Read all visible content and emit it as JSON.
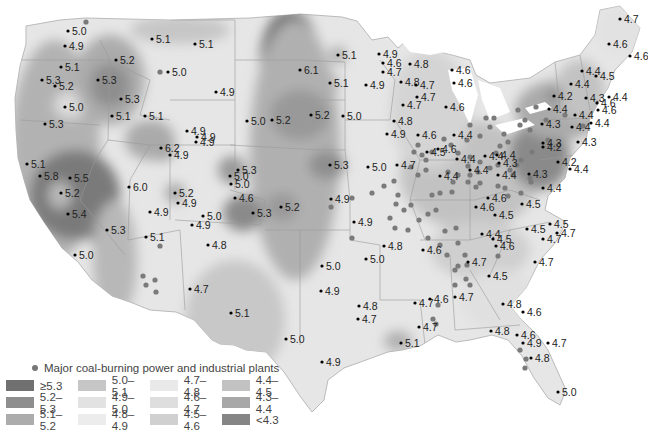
{
  "legend": {
    "plants_label": "Major coal-burning power and industrial plants",
    "items": [
      {
        "label": "≥5.3",
        "color": "#707070"
      },
      {
        "label": "5.0–5.1",
        "color": "#c6c6c6"
      },
      {
        "label": "4.7–4.8",
        "color": "#e9e9e9"
      },
      {
        "label": "4.4–4.5",
        "color": "#c2c2c2"
      },
      {
        "label": "5.2–5.3",
        "color": "#8e8e8e"
      },
      {
        "label": "4.9–5.0",
        "color": "#e2e2e2"
      },
      {
        "label": "4.6–4.7",
        "color": "#dedede"
      },
      {
        "label": "4.3–4.4",
        "color": "#a8a8a8"
      },
      {
        "label": "5.1–5.2",
        "color": "#acacac"
      },
      {
        "label": "4.8–4.9",
        "color": "#ececec"
      },
      {
        "label": "4.5–4.6",
        "color": "#d0d0d0"
      },
      {
        "label": "<4.3",
        "color": "#858585"
      }
    ]
  },
  "stations": [
    {
      "v": "5.0",
      "x": 68,
      "y": 31
    },
    {
      "v": "4.9",
      "x": 65,
      "y": 46
    },
    {
      "v": "5.1",
      "x": 61,
      "y": 67
    },
    {
      "v": "5.3",
      "x": 42,
      "y": 80
    },
    {
      "v": "5.2",
      "x": 55,
      "y": 86
    },
    {
      "v": "5.0",
      "x": 65,
      "y": 107
    },
    {
      "v": "5.3",
      "x": 45,
      "y": 124
    },
    {
      "v": "5.2",
      "x": 116,
      "y": 60
    },
    {
      "v": "5.3",
      "x": 98,
      "y": 80
    },
    {
      "v": "5.3",
      "x": 121,
      "y": 99
    },
    {
      "v": "5.1",
      "x": 112,
      "y": 116
    },
    {
      "v": "5.1",
      "x": 145,
      "y": 116
    },
    {
      "v": "5.1",
      "x": 152,
      "y": 39
    },
    {
      "v": "5.1",
      "x": 195,
      "y": 44
    },
    {
      "v": "5.0",
      "x": 168,
      "y": 72
    },
    {
      "v": "4.9",
      "x": 216,
      "y": 92
    },
    {
      "v": "4.9",
      "x": 187,
      "y": 131
    },
    {
      "v": "4.9",
      "x": 197,
      "y": 137
    },
    {
      "v": "4.9",
      "x": 196,
      "y": 142
    },
    {
      "v": "6.2",
      "x": 161,
      "y": 148
    },
    {
      "v": "4.9",
      "x": 170,
      "y": 155
    },
    {
      "v": "5.1",
      "x": 27,
      "y": 164
    },
    {
      "v": "5.8",
      "x": 40,
      "y": 176
    },
    {
      "v": "5.5",
      "x": 70,
      "y": 178
    },
    {
      "v": "5.2",
      "x": 61,
      "y": 193
    },
    {
      "v": "5.4",
      "x": 68,
      "y": 214
    },
    {
      "v": "5.0",
      "x": 75,
      "y": 255
    },
    {
      "v": "6.0",
      "x": 129,
      "y": 187
    },
    {
      "v": "5.2",
      "x": 175,
      "y": 193
    },
    {
      "v": "4.9",
      "x": 178,
      "y": 203
    },
    {
      "v": "4.9",
      "x": 150,
      "y": 212
    },
    {
      "v": "5.3",
      "x": 107,
      "y": 230
    },
    {
      "v": "5.1",
      "x": 146,
      "y": 237
    },
    {
      "v": "5.0",
      "x": 203,
      "y": 216
    },
    {
      "v": "4.9",
      "x": 192,
      "y": 225
    },
    {
      "v": "4.8",
      "x": 208,
      "y": 245
    },
    {
      "v": "4.7",
      "x": 190,
      "y": 289
    },
    {
      "v": "5.1",
      "x": 231,
      "y": 313
    },
    {
      "v": "5.0",
      "x": 286,
      "y": 339
    },
    {
      "v": "4.9",
      "x": 322,
      "y": 362
    },
    {
      "v": "6.1",
      "x": 300,
      "y": 70
    },
    {
      "v": "5.0",
      "x": 247,
      "y": 121
    },
    {
      "v": "5.2",
      "x": 272,
      "y": 120
    },
    {
      "v": "5.2",
      "x": 311,
      "y": 115
    },
    {
      "v": "5.0",
      "x": 343,
      "y": 116
    },
    {
      "v": "5.3",
      "x": 238,
      "y": 170
    },
    {
      "v": "5.0",
      "x": 230,
      "y": 176
    },
    {
      "v": "5.0",
      "x": 231,
      "y": 184
    },
    {
      "v": "4.6",
      "x": 235,
      "y": 198
    },
    {
      "v": "5.3",
      "x": 253,
      "y": 213
    },
    {
      "v": "5.2",
      "x": 281,
      "y": 207
    },
    {
      "v": "5.3",
      "x": 330,
      "y": 165
    },
    {
      "v": "5.0",
      "x": 368,
      "y": 167
    },
    {
      "v": "4.9",
      "x": 331,
      "y": 199
    },
    {
      "v": "4.9",
      "x": 354,
      "y": 222
    },
    {
      "v": "5.0",
      "x": 322,
      "y": 266
    },
    {
      "v": "4.9",
      "x": 321,
      "y": 291
    },
    {
      "v": "4.8",
      "x": 359,
      "y": 306
    },
    {
      "v": "4.7",
      "x": 358,
      "y": 319
    },
    {
      "v": "5.1",
      "x": 338,
      "y": 55
    },
    {
      "v": "5.1",
      "x": 330,
      "y": 83
    },
    {
      "v": "4.9",
      "x": 366,
      "y": 85
    },
    {
      "v": "4.9",
      "x": 379,
      "y": 54
    },
    {
      "v": "4.6",
      "x": 383,
      "y": 63
    },
    {
      "v": "4.8",
      "x": 410,
      "y": 64
    },
    {
      "v": "4.7",
      "x": 383,
      "y": 72
    },
    {
      "v": "4.8",
      "x": 401,
      "y": 82
    },
    {
      "v": "4.7",
      "x": 416,
      "y": 85
    },
    {
      "v": "4.7",
      "x": 417,
      "y": 97
    },
    {
      "v": "4.7",
      "x": 403,
      "y": 105
    },
    {
      "v": "4.8",
      "x": 394,
      "y": 121
    },
    {
      "v": "4.9",
      "x": 387,
      "y": 134
    },
    {
      "v": "4.6",
      "x": 452,
      "y": 70
    },
    {
      "v": "4.6",
      "x": 454,
      "y": 83
    },
    {
      "v": "4.6",
      "x": 446,
      "y": 107
    },
    {
      "v": "4.6",
      "x": 418,
      "y": 135
    },
    {
      "v": "4.4",
      "x": 454,
      "y": 135
    },
    {
      "v": "4.7",
      "x": 397,
      "y": 165
    },
    {
      "v": "4.5",
      "x": 427,
      "y": 152
    },
    {
      "v": "4.6",
      "x": 438,
      "y": 149
    },
    {
      "v": "4.4",
      "x": 457,
      "y": 159
    },
    {
      "v": "4.4",
      "x": 440,
      "y": 176
    },
    {
      "v": "4.4",
      "x": 485,
      "y": 156
    },
    {
      "v": "4.4",
      "x": 470,
      "y": 170
    },
    {
      "v": "4.4",
      "x": 497,
      "y": 155
    },
    {
      "v": "4.4",
      "x": 498,
      "y": 175
    },
    {
      "v": "4.3",
      "x": 499,
      "y": 163
    },
    {
      "v": "4.3",
      "x": 529,
      "y": 174
    },
    {
      "v": "4.6",
      "x": 488,
      "y": 198
    },
    {
      "v": "4.6",
      "x": 476,
      "y": 207
    },
    {
      "v": "4.5",
      "x": 495,
      "y": 215
    },
    {
      "v": "4.8",
      "x": 384,
      "y": 246
    },
    {
      "v": "4.6",
      "x": 423,
      "y": 250
    },
    {
      "v": "5.0",
      "x": 366,
      "y": 259
    },
    {
      "v": "4.4",
      "x": 482,
      "y": 234
    },
    {
      "v": "4.5",
      "x": 493,
      "y": 239
    },
    {
      "v": "4.6",
      "x": 496,
      "y": 246
    },
    {
      "v": "4.7",
      "x": 468,
      "y": 262
    },
    {
      "v": "4.5",
      "x": 489,
      "y": 276
    },
    {
      "v": "4.5",
      "x": 527,
      "y": 229
    },
    {
      "v": "4.5",
      "x": 550,
      "y": 224
    },
    {
      "v": "4.7",
      "x": 557,
      "y": 233
    },
    {
      "v": "4.7",
      "x": 543,
      "y": 239
    },
    {
      "v": "4.7",
      "x": 535,
      "y": 262
    },
    {
      "v": "4.7",
      "x": 415,
      "y": 303
    },
    {
      "v": "4.6",
      "x": 430,
      "y": 299
    },
    {
      "v": "4.7",
      "x": 455,
      "y": 297
    },
    {
      "v": "4.8",
      "x": 503,
      "y": 304
    },
    {
      "v": "4.6",
      "x": 523,
      "y": 312
    },
    {
      "v": "4.8",
      "x": 491,
      "y": 331
    },
    {
      "v": "4.6",
      "x": 517,
      "y": 335
    },
    {
      "v": "4.9",
      "x": 523,
      "y": 343
    },
    {
      "v": "4.7",
      "x": 548,
      "y": 343
    },
    {
      "v": "4.8",
      "x": 531,
      "y": 358
    },
    {
      "v": "5.0",
      "x": 558,
      "y": 392
    },
    {
      "v": "4.7",
      "x": 419,
      "y": 327
    },
    {
      "v": "5.1",
      "x": 401,
      "y": 343
    },
    {
      "v": "4.7",
      "x": 620,
      "y": 19
    },
    {
      "v": "4.6",
      "x": 609,
      "y": 44
    },
    {
      "v": "4.6",
      "x": 630,
      "y": 56
    },
    {
      "v": "4.4",
      "x": 582,
      "y": 71
    },
    {
      "v": "4.4",
      "x": 571,
      "y": 84
    },
    {
      "v": "4.5",
      "x": 596,
      "y": 76
    },
    {
      "v": "4.3",
      "x": 586,
      "y": 98
    },
    {
      "v": "4.4",
      "x": 609,
      "y": 97
    },
    {
      "v": "4.2",
      "x": 554,
      "y": 96
    },
    {
      "v": "4.4",
      "x": 549,
      "y": 109
    },
    {
      "v": "4.4",
      "x": 575,
      "y": 115
    },
    {
      "v": "4.6",
      "x": 597,
      "y": 103
    },
    {
      "v": "4.4",
      "x": 591,
      "y": 123
    },
    {
      "v": "4.3",
      "x": 542,
      "y": 124
    },
    {
      "v": "4.4",
      "x": 572,
      "y": 127
    },
    {
      "v": "4.6",
      "x": 598,
      "y": 110
    },
    {
      "v": "4.3",
      "x": 543,
      "y": 143
    },
    {
      "v": "4.2",
      "x": 543,
      "y": 147
    },
    {
      "v": "4.3",
      "x": 578,
      "y": 142
    },
    {
      "v": "4.2",
      "x": 558,
      "y": 162
    },
    {
      "v": "4.4",
      "x": 570,
      "y": 169
    },
    {
      "v": "4.4",
      "x": 543,
      "y": 188
    },
    {
      "v": "4.5",
      "x": 522,
      "y": 204
    }
  ],
  "plants": [
    [
      86,
      22
    ],
    [
      160,
      72
    ],
    [
      143,
      276
    ],
    [
      155,
      280
    ],
    [
      146,
      285
    ],
    [
      156,
      292
    ],
    [
      160,
      246
    ],
    [
      352,
      238
    ],
    [
      331,
      207
    ],
    [
      352,
      198
    ],
    [
      372,
      193
    ],
    [
      384,
      186
    ],
    [
      394,
      181
    ],
    [
      398,
      195
    ],
    [
      396,
      204
    ],
    [
      404,
      210
    ],
    [
      390,
      218
    ],
    [
      395,
      228
    ],
    [
      408,
      230
    ],
    [
      411,
      205
    ],
    [
      419,
      220
    ],
    [
      432,
      195
    ],
    [
      436,
      210
    ],
    [
      428,
      214
    ],
    [
      411,
      167
    ],
    [
      418,
      175
    ],
    [
      426,
      170
    ],
    [
      448,
      172
    ],
    [
      453,
      182
    ],
    [
      468,
      182
    ],
    [
      468,
      166
    ],
    [
      470,
      157
    ],
    [
      478,
      172
    ],
    [
      476,
      187
    ],
    [
      490,
      168
    ],
    [
      452,
      192
    ],
    [
      458,
      175
    ],
    [
      440,
      193
    ],
    [
      428,
      238
    ],
    [
      445,
      231
    ],
    [
      456,
      228
    ],
    [
      440,
      245
    ],
    [
      458,
      243
    ],
    [
      465,
      255
    ],
    [
      458,
      266
    ],
    [
      466,
      279
    ],
    [
      455,
      285
    ],
    [
      470,
      285
    ],
    [
      467,
      265
    ],
    [
      447,
      255
    ],
    [
      455,
      270
    ],
    [
      433,
      319
    ],
    [
      438,
      305
    ],
    [
      498,
      256
    ],
    [
      436,
      324
    ],
    [
      526,
      359
    ],
    [
      525,
      368
    ],
    [
      520,
      350
    ],
    [
      470,
      175
    ],
    [
      480,
      162
    ],
    [
      480,
      183
    ],
    [
      498,
      186
    ],
    [
      521,
      193
    ],
    [
      530,
      178
    ],
    [
      531,
      182
    ],
    [
      510,
      170
    ],
    [
      517,
      165
    ],
    [
      505,
      188
    ],
    [
      508,
      196
    ],
    [
      513,
      175
    ],
    [
      508,
      142
    ],
    [
      500,
      146
    ],
    [
      496,
      153
    ],
    [
      504,
      134
    ],
    [
      525,
      120
    ],
    [
      548,
      140
    ],
    [
      565,
      115
    ],
    [
      583,
      126
    ],
    [
      546,
      120
    ],
    [
      536,
      107
    ],
    [
      518,
      110
    ],
    [
      520,
      125
    ],
    [
      530,
      130
    ],
    [
      532,
      152
    ],
    [
      521,
      160
    ],
    [
      498,
      165
    ],
    [
      486,
      118
    ],
    [
      494,
      118
    ],
    [
      490,
      127
    ],
    [
      480,
      136
    ],
    [
      470,
      125
    ],
    [
      467,
      140
    ],
    [
      458,
      153
    ],
    [
      444,
      139
    ],
    [
      451,
      145
    ],
    [
      426,
      160
    ],
    [
      432,
      152
    ],
    [
      418,
      145
    ],
    [
      422,
      155
    ],
    [
      414,
      152
    ]
  ]
}
